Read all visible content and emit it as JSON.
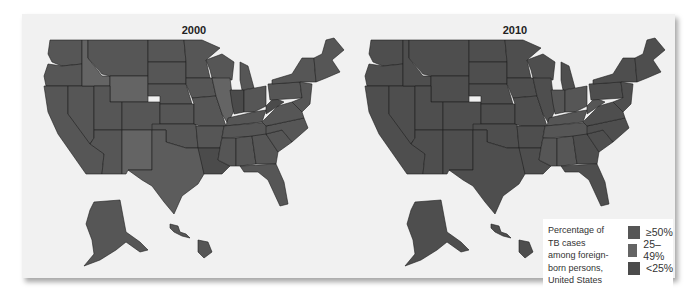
{
  "maps": [
    {
      "title": "2000",
      "left": 0
    },
    {
      "title": "2010",
      "left": 325
    }
  ],
  "legend": {
    "title_lines": [
      "Percentage of",
      "TB cases",
      "among foreign-",
      "born persons,",
      "United States"
    ],
    "items": [
      {
        "label": "≥50%",
        "color": "#565656"
      },
      {
        "label": "25–49%",
        "color": "#646464"
      },
      {
        "label": "<25%",
        "color": "#4b4b4b"
      }
    ]
  },
  "colors": {
    "ge50": "#565656",
    "25to49": "#646464",
    "lt25": "#4b4b4b",
    "panel_bg": "#f1f1f1"
  }
}
